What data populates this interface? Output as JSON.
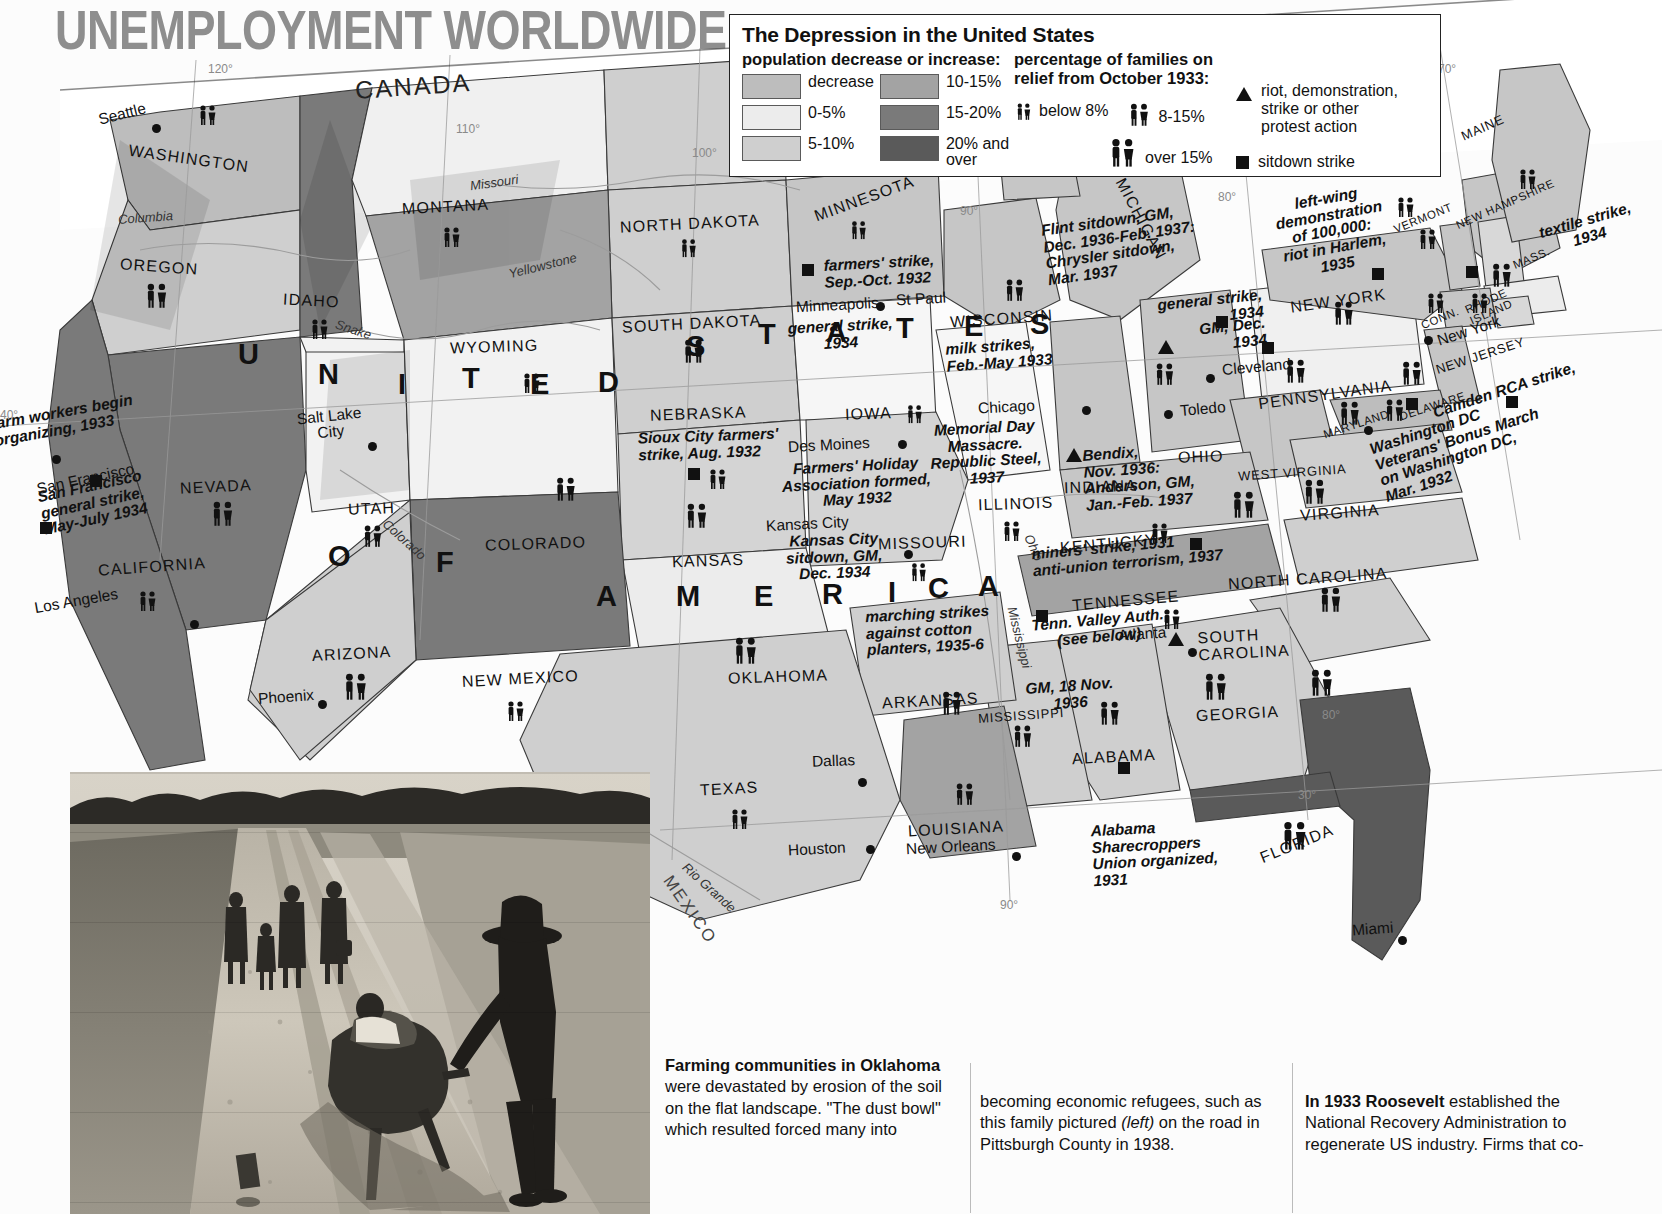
{
  "title": "UNEMPLOYMENT WORLDWIDE",
  "legend": {
    "heading": "The Depression in the United States",
    "population_header": "population decrease or increase:",
    "population_classes": [
      {
        "label": "decrease",
        "color": "#bdbdbd"
      },
      {
        "label": "0-5%",
        "color": "#ececec"
      },
      {
        "label": "5-10%",
        "color": "#cfcfcf"
      },
      {
        "label": "10-15%",
        "color": "#a3a3a3"
      },
      {
        "label": "15-20%",
        "color": "#7a7a7a"
      },
      {
        "label": "20% and over",
        "color": "#5a5a5a"
      }
    ],
    "relief_header_l1": "percentage of families on",
    "relief_header_l2": "relief from October 1933:",
    "relief_classes": [
      {
        "label": "below 8%",
        "size": "small"
      },
      {
        "label": "8-15%",
        "size": "medium"
      },
      {
        "label": "over 15%",
        "size": "large"
      }
    ],
    "symbols": [
      {
        "icon": "triangle",
        "label": "riot, demonstration,\nstrike or other\nprotest action"
      },
      {
        "icon": "square",
        "label": "sitdown strike"
      }
    ]
  },
  "map": {
    "countries": [
      {
        "name": "CANADA"
      },
      {
        "name": "MEXICO"
      }
    ],
    "big_letters": [
      "U",
      "N",
      "I",
      "T",
      "E",
      "D",
      "S",
      "T",
      "A",
      "T",
      "E",
      "S",
      "O",
      "F",
      "A",
      "M",
      "E",
      "R",
      "I",
      "C",
      "A"
    ],
    "states": [
      "WASHINGTON",
      "OREGON",
      "IDAHO",
      "MONTANA",
      "NORTH DAKOTA",
      "SOUTH DAKOTA",
      "WYOMING",
      "NEVADA",
      "UTAH",
      "COLORADO",
      "NEBRASKA",
      "IOWA",
      "MINNESOTA",
      "WISCONSIN",
      "MICHIGAN",
      "CALIFORNIA",
      "ARIZONA",
      "NEW MEXICO",
      "KANSAS",
      "MISSOURI",
      "ILLINOIS",
      "INDIANA",
      "OHIO",
      "OKLAHOMA",
      "ARKANSAS",
      "TENNESSEE",
      "KENTUCKY",
      "WEST VIRGINIA",
      "VIRGINIA",
      "NORTH CAROLINA",
      "SOUTH CAROLINA",
      "GEORGIA",
      "ALABAMA",
      "MISSISSIPPI",
      "LOUISIANA",
      "TEXAS",
      "FLORIDA",
      "MAINE",
      "VERMONT",
      "NEW HAMPSHIRE",
      "MASS.",
      "CONN.",
      "RHODE ISLAND",
      "NEW YORK",
      "NEW JERSEY",
      "PENNSYLVANIA",
      "DELAWARE",
      "MARYLAND"
    ],
    "cities": [
      "Seattle",
      "Salt Lake City",
      "San Francisco",
      "Los Angeles",
      "Phoenix",
      "Minneapolis",
      "St Paul",
      "Des Moines",
      "Kansas City",
      "Chicago",
      "Cleveland",
      "Toledo",
      "Dallas",
      "Houston",
      "New Orleans",
      "Atlanta",
      "Miami",
      "New York",
      "Washington DC"
    ],
    "rivers": [
      "Columbia",
      "Snake",
      "Missouri",
      "Yellowstone",
      "Colorado",
      "Ohio",
      "Mississippi",
      "Rio Grande"
    ],
    "graticule": [
      "120°",
      "110°",
      "100°",
      "90°",
      "80°",
      "70°",
      "40°",
      "30°"
    ],
    "events": [
      {
        "text": "farm workers begin\norganizing, 1933",
        "marker": "square"
      },
      {
        "text": "San Francisco\ngeneral strike,\nMay-July 1934",
        "marker": "square"
      },
      {
        "text": "farmers' strike,\nSep.-Oct. 1932",
        "marker": "square"
      },
      {
        "text": "general strike,\n1934",
        "marker": "none"
      },
      {
        "text": "milk strikes,\nFeb.-May 1933",
        "marker": "none"
      },
      {
        "text": "Sioux City farmers'\nstrike, Aug. 1932",
        "marker": "square"
      },
      {
        "text": "Farmers' Holiday\nAssociation formed,\nMay 1932",
        "marker": "none"
      },
      {
        "text": "Kansas City\nsitdown, GM,\nDec. 1934",
        "marker": "none"
      },
      {
        "text": "Memorial Day\nMassacre.\nRepublic Steel,\n1937",
        "marker": "none"
      },
      {
        "text": "Flint sitdown, GM,\nDec. 1936-Feb. 1937:\nChrysler sitdown,\nMar. 1937",
        "marker": "triangle"
      },
      {
        "text": "general strike,\n1934",
        "marker": "square"
      },
      {
        "text": "GM, Dec.\n1934",
        "marker": "square"
      },
      {
        "text": "Bendix,\nNov. 1936:\nAnderson, GM,\nJan.-Feb. 1937",
        "marker": "triangle"
      },
      {
        "text": "left-wing\ndemonstration\nof 100,000:\nriot in Harlem,\n1935",
        "marker": "square"
      },
      {
        "text": "textile strike,\n1934",
        "marker": "square"
      },
      {
        "text": "Camden RCA strike,",
        "marker": "square"
      },
      {
        "text": "Washington DC\nVeterans' Bonus March\non Washington DC,\nMar. 1932",
        "marker": "square"
      },
      {
        "text": "miners' strike, 1931\nanti-union terrorism, 1937",
        "marker": "square"
      },
      {
        "text": "Tenn. Valley Auth.\n(see below)",
        "marker": "none"
      },
      {
        "text": "marching strikes\nagainst cotton\nplanters, 1935-6",
        "marker": "square"
      },
      {
        "text": "GM, 18 Nov.\n1936",
        "marker": "triangle"
      },
      {
        "text": "Alabama\nSharecroppers\nUnion organized,\n1931",
        "marker": "square"
      }
    ]
  },
  "captions": {
    "col1_bold": "Farming communities in Oklahoma",
    "col1_text": " were devastated by erosion of the soil on the flat landscape. \"The dust bowl\" which resulted forced many into",
    "col2_text": "becoming economic refugees, such as this family pictured ",
    "col2_italic": "(left)",
    "col2_text2": " on the road in Pittsburgh County in 1938.",
    "col3_bold": "In 1933 Roosevelt",
    "col3_text": " established the National Recovery Administration to regenerate US industry. Firms that co-"
  }
}
